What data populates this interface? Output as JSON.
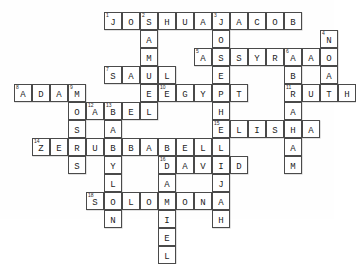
{
  "puzzle": {
    "title": "Bible crossword puzzle",
    "cell_size": 18,
    "origin_x": 14,
    "origin_y": 12,
    "entries": [
      {
        "number": "1",
        "answer": "JOSHUA",
        "direction": "across",
        "col": 6,
        "row": 1
      },
      {
        "number": "2",
        "answer": "SAMUEL",
        "direction": "down",
        "col": 8,
        "row": 1
      },
      {
        "number": "3",
        "answer": "JACOB",
        "direction": "across",
        "col": 12,
        "row": 1
      },
      {
        "number": "3b",
        "answer": "JOSEPH",
        "direction": "down",
        "col": 12,
        "row": 1
      },
      {
        "number": "4",
        "answer": "NOAH",
        "direction": "down",
        "col": 18,
        "row": 2
      },
      {
        "number": "5",
        "answer": "ASSYRIA",
        "direction": "across",
        "col": 11,
        "row": 3
      },
      {
        "number": "6",
        "answer": "ABRAHAM",
        "direction": "down",
        "col": 16,
        "row": 3
      },
      {
        "number": "7",
        "answer": "SAUL",
        "direction": "across",
        "col": 6,
        "row": 4
      },
      {
        "number": "8",
        "answer": "ADAM",
        "direction": "across",
        "col": 1,
        "row": 5
      },
      {
        "number": "9",
        "answer": "MOSES",
        "direction": "down",
        "col": 4,
        "row": 5
      },
      {
        "number": "10",
        "answer": "EGYPT",
        "direction": "across",
        "col": 9,
        "row": 5
      },
      {
        "number": "11",
        "answer": "RUTH",
        "direction": "across",
        "col": 16,
        "row": 5
      },
      {
        "number": "12",
        "answer": "ABEL",
        "direction": "across",
        "col": 5,
        "row": 6
      },
      {
        "number": "13",
        "answer": "BABYLON",
        "direction": "down",
        "col": 6,
        "row": 6
      },
      {
        "number": "14",
        "answer": "ZERUBBABEL",
        "direction": "across",
        "col": 2,
        "row": 8
      },
      {
        "number": "15",
        "answer": "ELISHA",
        "direction": "across",
        "col": 12,
        "row": 7
      },
      {
        "number": "16",
        "answer": "DAVID",
        "direction": "across",
        "col": 9,
        "row": 9
      },
      {
        "number": "16b",
        "answer": "DANIEL",
        "direction": "down",
        "col": 9,
        "row": 9
      },
      {
        "number": "17",
        "answer": "ELIJAH",
        "direction": "down",
        "col": 12,
        "row": 7
      },
      {
        "number": "18",
        "answer": "SOLOMON",
        "direction": "across",
        "col": 5,
        "row": 11
      }
    ]
  }
}
